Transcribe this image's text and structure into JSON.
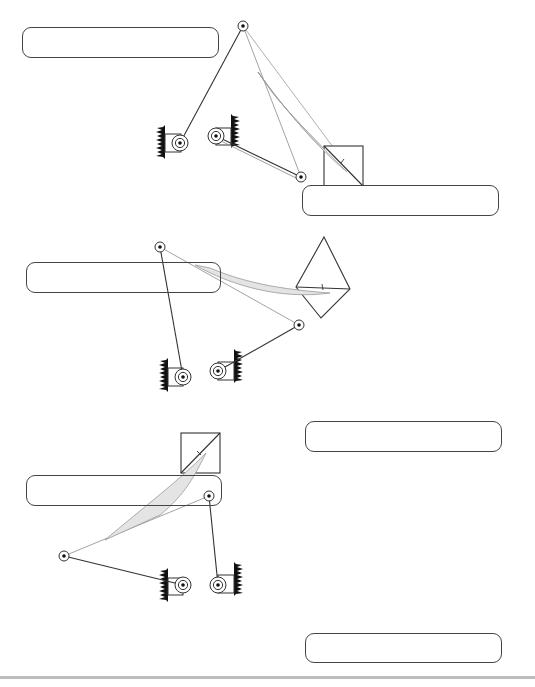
{
  "figure": {
    "stroke_color": "#333333",
    "fill_color": "#e4e4e4",
    "ground_color": "#111111"
  },
  "label_boxes": [
    {
      "id": "box-1",
      "text": "",
      "x": 22,
      "y": 27,
      "w": 197,
      "h": 31
    },
    {
      "id": "box-2",
      "text": "",
      "x": 302,
      "y": 185,
      "w": 197,
      "h": 31
    },
    {
      "id": "box-3",
      "text": "",
      "x": 26,
      "y": 262,
      "w": 195,
      "h": 31
    },
    {
      "id": "box-4",
      "text": "",
      "x": 305,
      "y": 421,
      "w": 197,
      "h": 31
    },
    {
      "id": "box-5",
      "text": "",
      "x": 26,
      "y": 475,
      "w": 196,
      "h": 31
    },
    {
      "id": "box-6",
      "text": "",
      "x": 305,
      "y": 633,
      "w": 197,
      "h": 30
    }
  ],
  "configurations": [
    {
      "name": "position-1",
      "ground_pivots": [
        {
          "x": 180,
          "y": 143,
          "wall": "left"
        },
        {
          "x": 216,
          "y": 136,
          "wall": "right"
        }
      ],
      "moving_pivots": [
        {
          "x": 243,
          "y": 26
        },
        {
          "x": 301,
          "y": 177
        }
      ],
      "tool": {
        "type": "square",
        "x": 324,
        "y": 146,
        "size": 39,
        "rotate": 0
      }
    },
    {
      "name": "position-2",
      "ground_pivots": [
        {
          "x": 183,
          "y": 377,
          "wall": "left"
        },
        {
          "x": 218,
          "y": 371,
          "wall": "right"
        }
      ],
      "moving_pivots": [
        {
          "x": 160,
          "y": 247
        },
        {
          "x": 299,
          "y": 325
        }
      ],
      "tool": {
        "type": "square",
        "x": 296,
        "y": 261,
        "size": 39,
        "rotate": 45
      }
    },
    {
      "name": "position-3",
      "ground_pivots": [
        {
          "x": 183,
          "y": 585,
          "wall": "left"
        },
        {
          "x": 218,
          "y": 585,
          "wall": "right"
        }
      ],
      "moving_pivots": [
        {
          "x": 64,
          "y": 556
        },
        {
          "x": 209,
          "y": 496
        }
      ],
      "tool": {
        "type": "square",
        "x": 181,
        "y": 433,
        "size": 39,
        "rotate": 0
      }
    }
  ],
  "footer": {
    "text": ""
  }
}
